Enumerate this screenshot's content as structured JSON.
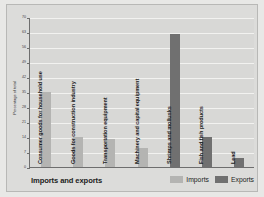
{
  "chart_data": {
    "type": "bar",
    "title": "Imports and exports",
    "xlabel": "",
    "ylabel": "Percentage of total",
    "ylim": [
      0,
      70
    ],
    "grid": true,
    "legend_position": "bottom-right",
    "yticks": [
      0,
      7,
      14,
      21,
      28,
      35,
      42,
      49,
      56,
      63,
      70
    ],
    "ytick_labels": [
      "0",
      "7",
      "14",
      "21",
      "28",
      "35",
      "42",
      "49",
      "56",
      "63",
      "70"
    ],
    "legend": [
      {
        "name": "Imports",
        "color": "#b4b4b2"
      },
      {
        "name": "Exports",
        "color": "#707070"
      }
    ],
    "categories": [
      "Consumer goods for household use",
      "Goods for construction industry",
      "Transportation equipment",
      "Machinery and capital equipment",
      "Shrimps and mollusks",
      "Fish and fish products",
      "Lead"
    ],
    "bars": [
      {
        "category": "Consumer goods for household use",
        "series": "Imports",
        "value": 35
      },
      {
        "category": "Goods for construction industry",
        "series": "Imports",
        "value": 14
      },
      {
        "category": "Transportation equipment",
        "series": "Imports",
        "value": 13
      },
      {
        "category": "Machinery and capital equipment",
        "series": "Imports",
        "value": 9
      },
      {
        "category": "Shrimps and mollusks",
        "series": "Exports",
        "value": 62
      },
      {
        "category": "Fish and fish products",
        "series": "Exports",
        "value": 14
      },
      {
        "category": "Lead",
        "series": "Exports",
        "value": 4
      }
    ]
  }
}
